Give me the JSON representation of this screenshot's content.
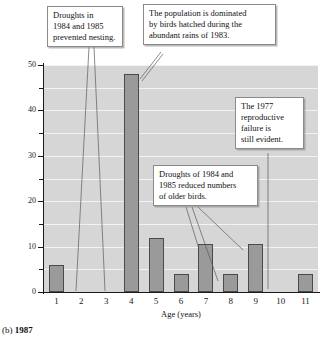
{
  "figure": {
    "caption_prefix": "(b)",
    "caption_year": "1987"
  },
  "chart_data": {
    "type": "bar",
    "title": "",
    "xlabel": "Age (years)",
    "ylabel": "Percentage of finches",
    "categories": [
      "1",
      "2",
      "3",
      "4",
      "5",
      "6",
      "7",
      "8",
      "9",
      "10",
      "11"
    ],
    "values": [
      6,
      0,
      0,
      48,
      12,
      4,
      10.5,
      4,
      10.5,
      0,
      4
    ],
    "ylim": [
      0,
      50
    ],
    "ytick_labels": [
      "0",
      "10",
      "20",
      "30",
      "40",
      "50"
    ],
    "ytick_values": [
      0,
      10,
      20,
      30,
      40,
      50
    ],
    "yminor_values": [
      5,
      15,
      25,
      35,
      45
    ],
    "grid": true,
    "legend": "none",
    "bar_color": "#9a9a9a",
    "bar_edge_color": "#4a4a4a",
    "plot_background": "#d6d6d6",
    "gridline_color": "#f2f2f2",
    "annotations": [
      {
        "id": "droughts-prevented-nesting",
        "text": "Droughts in 1984 and 1985 prevented nesting.",
        "lines": [
          "Droughts in",
          "1984 and 1985",
          "prevented nesting."
        ],
        "targets": [
          "2",
          "3"
        ]
      },
      {
        "id": "population-dominated-1983",
        "text": "The population is dominated by birds hatched during the abundant rains of 1983.",
        "lines": [
          "The population is dominated",
          "by birds hatched during the",
          "abundant rains of 1983."
        ],
        "targets": [
          "4"
        ]
      },
      {
        "id": "reproductive-failure-1977",
        "text": "The 1977 reproductive failure is still evident.",
        "lines": [
          "The 1977",
          "reproductive",
          "failure is",
          "still evident."
        ],
        "targets": [
          "10"
        ]
      },
      {
        "id": "droughts-reduced-older-birds",
        "text": "Droughts of 1984 and 1985 reduced numbers of older birds.",
        "lines": [
          "Droughts of 1984 and",
          "1985 reduced numbers",
          "of older birds."
        ],
        "targets": [
          "6",
          "8",
          "9"
        ]
      }
    ]
  }
}
